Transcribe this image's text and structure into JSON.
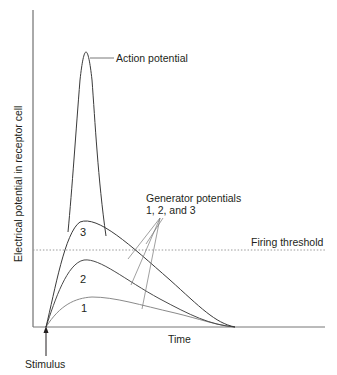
{
  "figure": {
    "y_axis_label": "Electrical potential in receptor cell",
    "x_axis_label": "Time",
    "stimulus_label": "Stimulus",
    "action_potential_label": "Action potential",
    "generator_label_line1": "Generator potentials",
    "generator_label_line2": "1, 2, and 3",
    "threshold_label": "Firing threshold",
    "curve_labels": [
      "1",
      "2",
      "3"
    ]
  },
  "colors": {
    "axis": "#555555",
    "curve_dark": "#3a3a3a",
    "curve_light": "#8a8a8a",
    "threshold": "#9a9a9a",
    "text": "#231f20"
  }
}
